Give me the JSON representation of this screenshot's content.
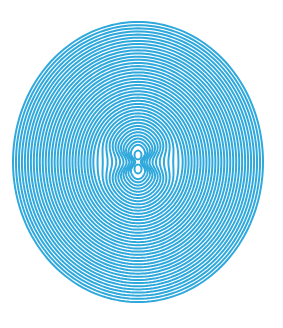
{
  "artwork": {
    "description": "concentric rings optical illusion with figure-eight center",
    "line_color": "#2fa8dc",
    "background_color": "#ffffff",
    "center": [
      138,
      162
    ],
    "outer_radius_x": 125,
    "outer_radius_y": 140,
    "ring_count": 40
  }
}
